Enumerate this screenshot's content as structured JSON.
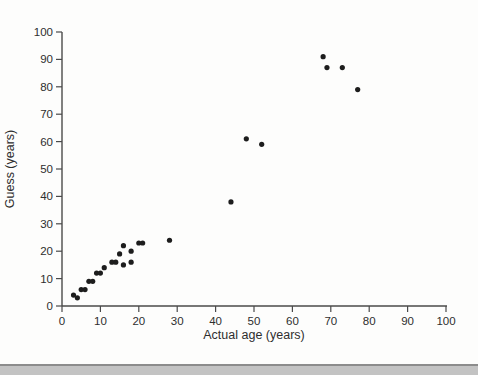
{
  "figure": {
    "background": "#fdfdfc",
    "bottom_rule_color": "#8c8c8c",
    "bottom_band_color": "#c3c3c3"
  },
  "chart_data": {
    "type": "scatter",
    "title": "",
    "xlabel": "Actual age (years)",
    "ylabel": "Guess (years)",
    "xlim": [
      0,
      100
    ],
    "ylim": [
      0,
      100
    ],
    "x_ticks": [
      0,
      10,
      20,
      30,
      40,
      50,
      60,
      70,
      80,
      90,
      100
    ],
    "y_ticks": [
      0,
      10,
      20,
      30,
      40,
      50,
      60,
      70,
      80,
      90,
      100
    ],
    "grid": false,
    "legend": false,
    "axis_color": "#4a4a4a",
    "tick_label_color": "#2e2e2e",
    "marker_color": "#1d1d1d",
    "points": [
      {
        "x": 3,
        "y": 4
      },
      {
        "x": 4,
        "y": 3
      },
      {
        "x": 5,
        "y": 6
      },
      {
        "x": 6,
        "y": 6
      },
      {
        "x": 7,
        "y": 9
      },
      {
        "x": 8,
        "y": 9
      },
      {
        "x": 9,
        "y": 12
      },
      {
        "x": 10,
        "y": 12
      },
      {
        "x": 11,
        "y": 14
      },
      {
        "x": 13,
        "y": 16
      },
      {
        "x": 14,
        "y": 16
      },
      {
        "x": 15,
        "y": 19
      },
      {
        "x": 16,
        "y": 15
      },
      {
        "x": 16,
        "y": 22
      },
      {
        "x": 18,
        "y": 16
      },
      {
        "x": 18,
        "y": 20
      },
      {
        "x": 20,
        "y": 23
      },
      {
        "x": 21,
        "y": 23
      },
      {
        "x": 28,
        "y": 24
      },
      {
        "x": 44,
        "y": 38
      },
      {
        "x": 48,
        "y": 61
      },
      {
        "x": 52,
        "y": 59
      },
      {
        "x": 68,
        "y": 91
      },
      {
        "x": 69,
        "y": 87
      },
      {
        "x": 73,
        "y": 87
      },
      {
        "x": 77,
        "y": 79
      }
    ]
  }
}
